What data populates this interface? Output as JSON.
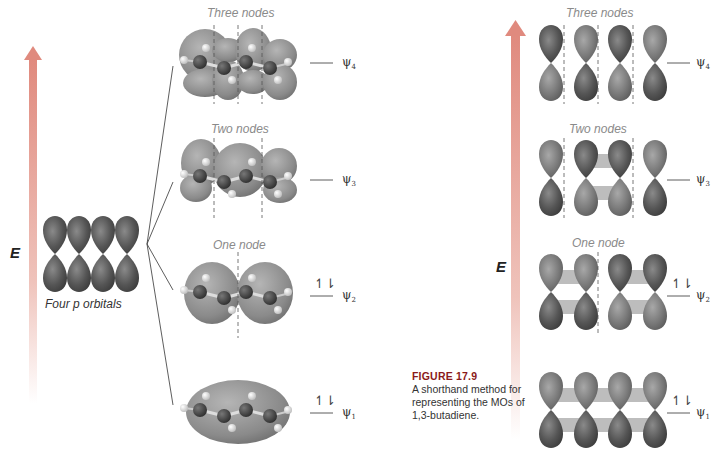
{
  "left_panel": {
    "axis_label": "E",
    "p_orbitals_label": "Four p orbitals",
    "levels": [
      {
        "psi": "ψ",
        "index": "4",
        "node_label": "Three nodes",
        "electrons": ""
      },
      {
        "psi": "ψ",
        "index": "3",
        "node_label": "Two nodes",
        "electrons": ""
      },
      {
        "psi": "ψ",
        "index": "2",
        "node_label": "One node",
        "electrons": "↿⇂"
      },
      {
        "psi": "ψ",
        "index": "1",
        "node_label": "",
        "electrons": "↿⇂"
      }
    ]
  },
  "right_panel": {
    "axis_label": "E",
    "levels": [
      {
        "psi": "ψ",
        "index": "4",
        "node_label": "Three nodes",
        "electrons": ""
      },
      {
        "psi": "ψ",
        "index": "3",
        "node_label": "Two nodes",
        "electrons": ""
      },
      {
        "psi": "ψ",
        "index": "2",
        "node_label": "One node",
        "electrons": "↿⇂"
      },
      {
        "psi": "ψ",
        "index": "1",
        "node_label": "",
        "electrons": "↿⇂"
      }
    ]
  },
  "caption": {
    "figure_number": "FIGURE 17.9",
    "text": "A shorthand method for representing the MOs of 1,3-butadiene."
  },
  "colors": {
    "arrow": "#e8a49a",
    "lobe_dark": "#5a5a5a",
    "mo_surface": "#8a8a8a",
    "node_label": "#8a8a8a",
    "caption_heading": "#8b1a1a"
  }
}
